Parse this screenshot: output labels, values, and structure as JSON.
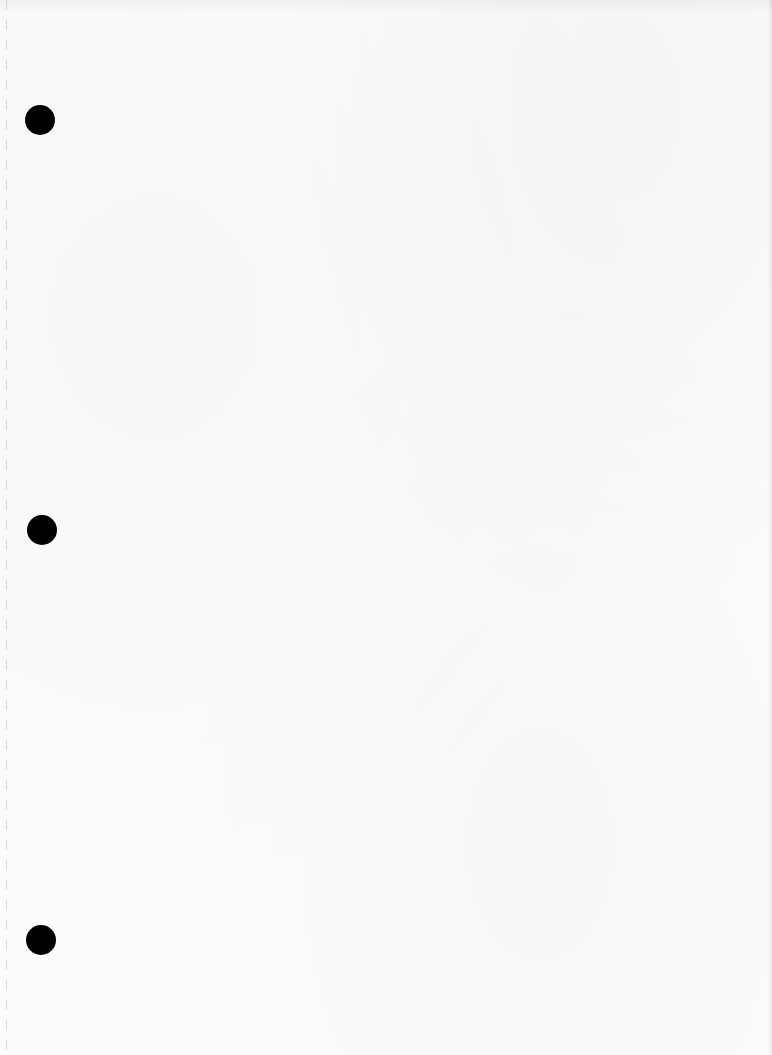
{
  "document": {
    "type": "blank-scanned-page",
    "text": "",
    "punch_holes": 3,
    "colors": {
      "paper": "#fcfcfc",
      "hole": "#000000"
    }
  }
}
